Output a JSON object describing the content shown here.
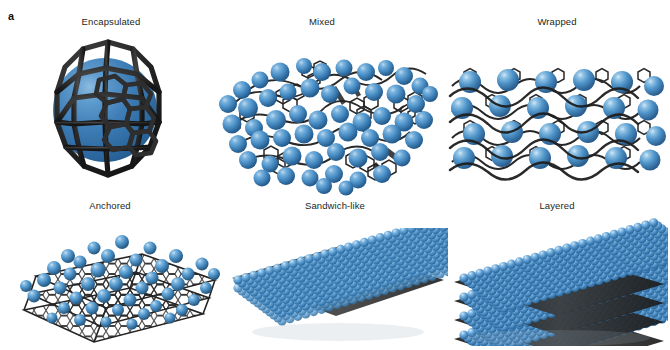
{
  "figure": {
    "subfigure_marker": "a",
    "background_color": "#ffffff",
    "sphere_color": "#3d7cb4",
    "sphere_color_light": "#5b9bd0",
    "carbon_color": "#2b2b2b"
  },
  "panels": [
    {
      "id": "encapsulated",
      "label": "Encapsulated",
      "description": "Single large blue nanoparticle fully enclosed inside a dark hexagonal carbon cage shell",
      "carbon_motif": "fullerene-cage",
      "particle_count": 1
    },
    {
      "id": "mixed",
      "label": "Mixed",
      "description": "Blue nanoparticles randomly intermixed with crumpled graphene sheets",
      "carbon_motif": "crumpled-sheets",
      "particle_count": 62
    },
    {
      "id": "wrapped",
      "label": "Wrapped",
      "description": "Array of blue nanoparticles enveloped by undulating carbon sheets",
      "carbon_motif": "undulating-wrap",
      "particle_count": 24
    },
    {
      "id": "anchored",
      "label": "Anchored",
      "description": "Blue nanoparticles anchored on the surface of stacked tilted graphene sheets",
      "carbon_motif": "planar-honeycomb-stack",
      "particle_count": 58
    },
    {
      "id": "sandwich-like",
      "label": "Sandwich-like",
      "description": "Dense close-packed monolayer of blue nanoparticles sandwiching a thin carbon sheet",
      "carbon_motif": "single-interlayer",
      "particle_count": 420
    },
    {
      "id": "layered",
      "label": "Layered",
      "description": "Multi-layer stack alternating slabs of blue nanoparticles and carbon sheets",
      "carbon_motif": "alternating-multilayer",
      "particle_count": 900,
      "layer_count": 4
    }
  ]
}
